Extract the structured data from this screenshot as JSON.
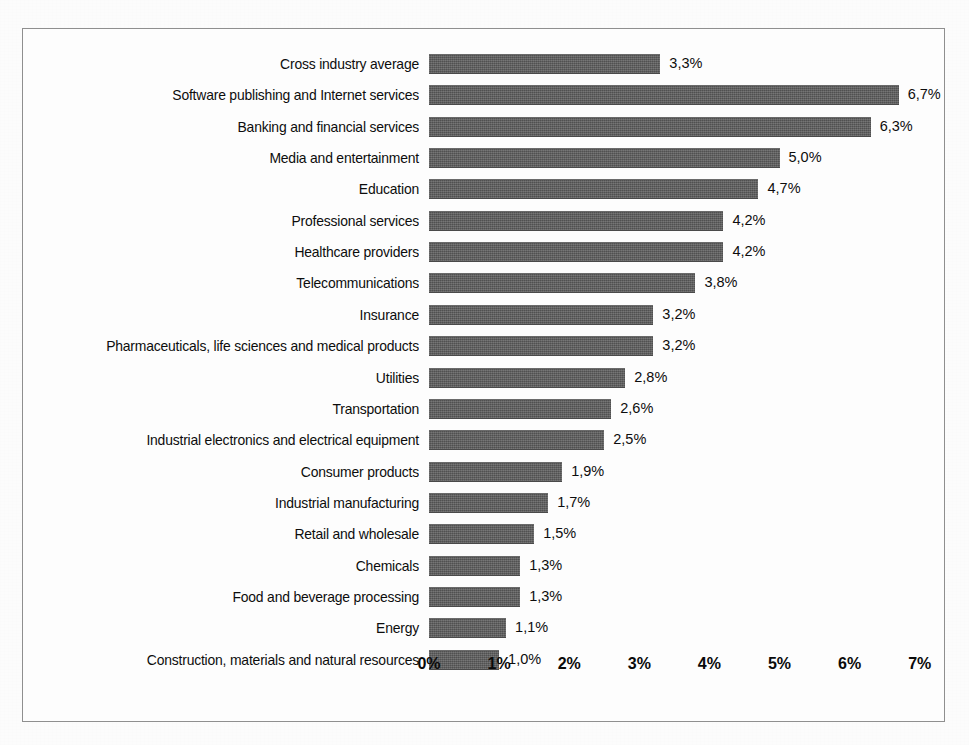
{
  "chart_data": {
    "type": "bar",
    "orientation": "horizontal",
    "title": "",
    "subtitle": "",
    "xlabel": "",
    "ylabel": "",
    "xlim": [
      0,
      7
    ],
    "grid": false,
    "legend": null,
    "value_suffix": "%",
    "decimal_separator": ",",
    "x_tick_labels": [
      "0%",
      "1%",
      "2%",
      "3%",
      "4%",
      "5%",
      "6%",
      "7%"
    ],
    "x_tick_values": [
      0,
      1,
      2,
      3,
      4,
      5,
      6,
      7
    ],
    "bar_color": "#5a5a5a",
    "categories": [
      "Cross industry average",
      "Software publishing and Internet services",
      "Banking and financial services",
      "Media and entertainment",
      "Education",
      "Professional services",
      "Healthcare providers",
      "Telecommunications",
      "Insurance",
      "Pharmaceuticals, life sciences and medical products",
      "Utilities",
      "Transportation",
      "Industrial electronics and electrical equipment",
      "Consumer products",
      "Industrial manufacturing",
      "Retail and wholesale",
      "Chemicals",
      "Food and beverage processing",
      "Energy",
      "Construction, materials and natural resources"
    ],
    "values": [
      3.3,
      6.7,
      6.3,
      5.0,
      4.7,
      4.2,
      4.2,
      3.8,
      3.2,
      3.2,
      2.8,
      2.6,
      2.5,
      1.9,
      1.7,
      1.5,
      1.3,
      1.3,
      1.1,
      1.0
    ],
    "value_labels": [
      "3,3%",
      "6,7%",
      "6,3%",
      "5,0%",
      "4,7%",
      "4,2%",
      "4,2%",
      "3,8%",
      "3,2%",
      "3,2%",
      "2,8%",
      "2,6%",
      "2,5%",
      "1,9%",
      "1,7%",
      "1,5%",
      "1,3%",
      "1,3%",
      "1,1%",
      "1,0%"
    ]
  }
}
